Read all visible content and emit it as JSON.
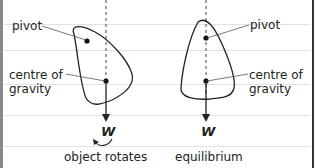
{
  "diagrams": [
    {
      "labels": {
        "pivot": "pivot",
        "cog": "centre of\ngravity",
        "weight": "W",
        "caption": "object rotates"
      }
    },
    {
      "labels": {
        "pivot": "pivot",
        "cog": "centre of\ngravity",
        "weight": "W",
        "caption": "equilibrium"
      }
    }
  ],
  "colors": {
    "line": "#222222",
    "rule": "#e2e2e2"
  }
}
